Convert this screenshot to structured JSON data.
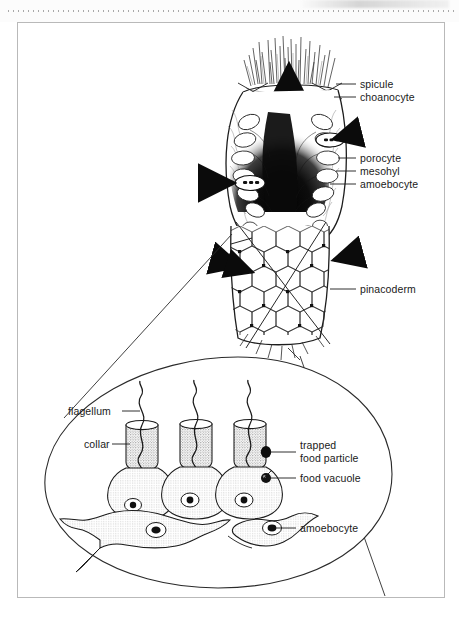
{
  "figure": {
    "kind": "sponge-anatomy-diagram",
    "ink_color": "#1a1a1a",
    "paper_color": "#ffffff",
    "border_color": "#b9b9b9"
  },
  "labels": {
    "spicule": "spicule",
    "choanocyte": "choanocyte",
    "porocyte": "porocyte",
    "mesohyl": "mesohyl",
    "amoebocyte_upper": "amoebocyte",
    "pinacoderm": "pinacoderm",
    "flagellum": "flagellum",
    "collar": "collar",
    "trapped_food_particle_line1": "trapped",
    "trapped_food_particle_line2": "food particle",
    "food_vacuole": "food vacuole",
    "amoebocyte_lower": "amoebocyte"
  }
}
